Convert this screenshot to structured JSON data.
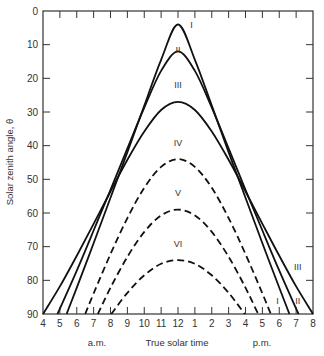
{
  "chart_data": {
    "type": "line",
    "title": "",
    "xlabel": "True solar time",
    "xlabel_am": "a.m.",
    "xlabel_pm": "p.m.",
    "ylabel": "Solar zenith angle, θ",
    "xlim": [
      4,
      20
    ],
    "ylim": [
      90,
      0
    ],
    "y_inverted": true,
    "grid": false,
    "x_ticks": [
      4,
      5,
      6,
      7,
      8,
      9,
      10,
      11,
      12,
      13,
      14,
      15,
      16,
      17,
      18,
      19,
      20
    ],
    "x_tick_labels": [
      "4",
      "5",
      "6",
      "7",
      "8",
      "9",
      "10",
      "11",
      "12",
      "1",
      "2",
      "3",
      "4",
      "5",
      "6",
      "7",
      "8"
    ],
    "y_ticks": [
      0,
      10,
      20,
      30,
      40,
      50,
      60,
      70,
      80,
      90
    ],
    "y_tick_labels": [
      "0",
      "10",
      "20",
      "30",
      "40",
      "50",
      "60",
      "70",
      "80",
      "90"
    ],
    "series": [
      {
        "name": "I",
        "style": "solid",
        "noon_zenith": 4,
        "half_day_hours": 6.6,
        "points": [
          [
            5.4,
            90
          ],
          [
            6,
            82.2
          ],
          [
            7,
            69.0
          ],
          [
            8,
            55.5
          ],
          [
            9,
            41.9
          ],
          [
            10,
            28.1
          ],
          [
            11,
            14.5
          ],
          [
            12,
            4
          ],
          [
            13,
            14.5
          ],
          [
            14,
            28.1
          ],
          [
            15,
            41.9
          ],
          [
            16,
            55.5
          ],
          [
            17,
            69.0
          ],
          [
            18,
            82.2
          ],
          [
            18.6,
            90
          ]
        ],
        "label_pos": [
          12.8,
          5
        ]
      },
      {
        "name": "II",
        "style": "solid",
        "noon_zenith": 12,
        "half_day_hours": 7.15,
        "points": [
          [
            4.85,
            90
          ],
          [
            5,
            88.4
          ],
          [
            6,
            77.1
          ],
          [
            7,
            65.2
          ],
          [
            8,
            53.1
          ],
          [
            9,
            40.8
          ],
          [
            10,
            28.7
          ],
          [
            11,
            17.8
          ],
          [
            12,
            12
          ],
          [
            13,
            17.8
          ],
          [
            14,
            28.7
          ],
          [
            15,
            40.8
          ],
          [
            16,
            53.1
          ],
          [
            17,
            65.2
          ],
          [
            18,
            77.1
          ],
          [
            19,
            88.4
          ],
          [
            19.15,
            90
          ]
        ],
        "label_pos": [
          12,
          12.5
        ]
      },
      {
        "name": "III",
        "style": "solid",
        "noon_zenith": 27,
        "half_day_hours": 8.0,
        "points": [
          [
            4,
            90
          ],
          [
            5,
            81.8
          ],
          [
            6,
            72.7
          ],
          [
            7,
            63.2
          ],
          [
            8,
            53.6
          ],
          [
            9,
            44.2
          ],
          [
            10,
            35.8
          ],
          [
            11,
            29.4
          ],
          [
            12,
            27
          ],
          [
            13,
            29.4
          ],
          [
            14,
            35.8
          ],
          [
            15,
            44.2
          ],
          [
            16,
            53.6
          ],
          [
            17,
            63.2
          ],
          [
            18,
            72.7
          ],
          [
            19,
            81.8
          ],
          [
            20,
            90
          ]
        ],
        "label_pos": [
          12,
          23
        ]
      },
      {
        "name": "IV",
        "style": "dashed",
        "noon_zenith": 44,
        "half_day_hours": 5.5,
        "points": [
          [
            6.5,
            90
          ],
          [
            7,
            83.9
          ],
          [
            8,
            72.2
          ],
          [
            9,
            61.5
          ],
          [
            10,
            52.5
          ],
          [
            11,
            46.3
          ],
          [
            12,
            44
          ],
          [
            13,
            46.3
          ],
          [
            14,
            52.5
          ],
          [
            15,
            61.5
          ],
          [
            16,
            72.2
          ],
          [
            17,
            83.9
          ],
          [
            17.5,
            90
          ]
        ],
        "label_pos": [
          12,
          40
        ]
      },
      {
        "name": "V",
        "style": "dashed",
        "noon_zenith": 59,
        "half_day_hours": 4.75,
        "points": [
          [
            7.25,
            90
          ],
          [
            8,
            82.2
          ],
          [
            9,
            73.0
          ],
          [
            10,
            65.6
          ],
          [
            11,
            60.7
          ],
          [
            12,
            59
          ],
          [
            13,
            60.7
          ],
          [
            14,
            65.6
          ],
          [
            15,
            73.0
          ],
          [
            16,
            82.2
          ],
          [
            16.75,
            90
          ]
        ],
        "label_pos": [
          12,
          55
        ]
      },
      {
        "name": "VI",
        "style": "dashed",
        "noon_zenith": 74,
        "half_day_hours": 3.95,
        "points": [
          [
            8.05,
            90
          ],
          [
            9,
            83.7
          ],
          [
            10,
            78.5
          ],
          [
            11,
            75.1
          ],
          [
            12,
            74
          ],
          [
            13,
            75.1
          ],
          [
            14,
            78.5
          ],
          [
            15,
            83.7
          ],
          [
            15.95,
            90
          ]
        ],
        "label_pos": [
          12,
          70
        ]
      }
    ],
    "annotations": [
      {
        "text": "I",
        "x": 17.9,
        "y": 87
      },
      {
        "text": "II",
        "x": 19.1,
        "y": 87
      },
      {
        "text": "III",
        "x": 19.1,
        "y": 77
      }
    ]
  }
}
